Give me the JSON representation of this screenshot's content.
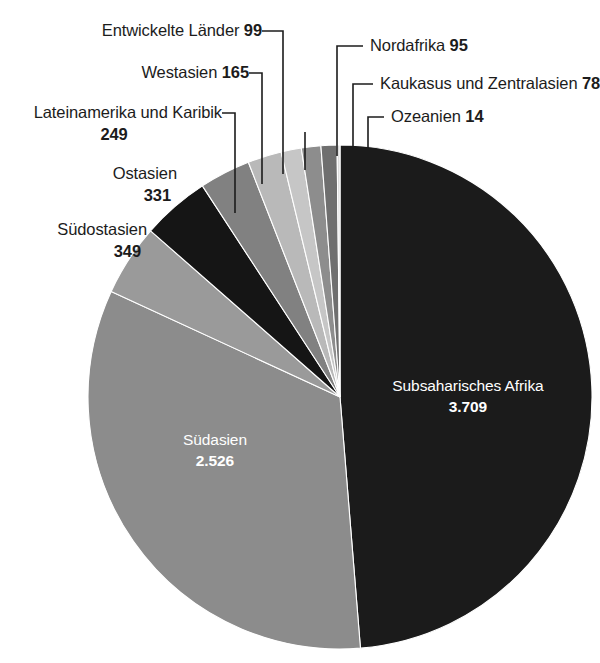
{
  "chart_data": {
    "type": "pie",
    "title": "",
    "unit": "",
    "total": 7615,
    "legend_position": "callouts",
    "categories": [
      "Subsaharisches Afrika",
      "Südasien",
      "Südostasien",
      "Ostasien",
      "Lateinamerika und Karibik",
      "Westasien",
      "Entwickelte Länder",
      "Nordafrika",
      "Kaukasus und Zentralasien",
      "Ozeanien"
    ],
    "values": [
      3709,
      2526,
      349,
      331,
      249,
      165,
      99,
      95,
      78,
      14
    ],
    "value_labels": [
      "3.709",
      "2.526",
      "349",
      "331",
      "249",
      "165",
      "99",
      "95",
      "78",
      "14"
    ],
    "colors": [
      "#1b1b1b",
      "#8c8c8c",
      "#9a9a9a",
      "#151515",
      "#818181",
      "#b9b9b9",
      "#c6c6c6",
      "#8d8d8d",
      "#6f6f6f",
      "#dcdcdc"
    ],
    "slices": [
      {
        "name": "Subsaharisches Afrika",
        "value": 3709,
        "value_label": "3.709",
        "color": "#1b1b1b",
        "label_placement": "inside"
      },
      {
        "name": "Südasien",
        "value": 2526,
        "value_label": "2.526",
        "color": "#8c8c8c",
        "label_placement": "inside"
      },
      {
        "name": "Südostasien",
        "value": 349,
        "value_label": "349",
        "color": "#9a9a9a",
        "label_placement": "callout-left"
      },
      {
        "name": "Ostasien",
        "value": 331,
        "value_label": "331",
        "color": "#151515",
        "label_placement": "callout-left"
      },
      {
        "name": "Lateinamerika und Karibik",
        "value": 249,
        "value_label": "249",
        "color": "#818181",
        "label_placement": "callout-left"
      },
      {
        "name": "Westasien",
        "value": 165,
        "value_label": "165",
        "color": "#b9b9b9",
        "label_placement": "callout-left"
      },
      {
        "name": "Entwickelte Länder",
        "value": 99,
        "value_label": "99",
        "color": "#c6c6c6",
        "label_placement": "callout-left"
      },
      {
        "name": "Nordafrika",
        "value": 95,
        "value_label": "95",
        "color": "#8d8d8d",
        "label_placement": "callout-right"
      },
      {
        "name": "Kaukasus und Zentralasien",
        "value": 78,
        "value_label": "78",
        "color": "#6f6f6f",
        "label_placement": "callout-right"
      },
      {
        "name": "Ozeanien",
        "value": 14,
        "value_label": "14",
        "color": "#dcdcdc",
        "label_placement": "callout-right"
      }
    ]
  },
  "callouts": {
    "entwickelte_laender": {
      "name": "Entwickelte Länder",
      "value": "99"
    },
    "westasien": {
      "name": "Westasien",
      "value": "165"
    },
    "lateinamerika": {
      "name": "Lateinamerika und Karibik",
      "value": "249"
    },
    "ostasien": {
      "name": "Ostasien",
      "value": "331"
    },
    "suedostasien": {
      "name": "Südostasien",
      "value": "349"
    },
    "nordafrika": {
      "name": "Nordafrika",
      "value": "95"
    },
    "kaukasus": {
      "name": "Kaukasus und Zentralasien",
      "value": "78"
    },
    "ozeanien": {
      "name": "Ozeanien",
      "value": "14"
    }
  },
  "inside_labels": {
    "subsaharisches_afrika": {
      "name": "Subsaharisches Afrika",
      "value": "3.709"
    },
    "suedasien": {
      "name": "Südasien",
      "value": "2.526"
    }
  }
}
